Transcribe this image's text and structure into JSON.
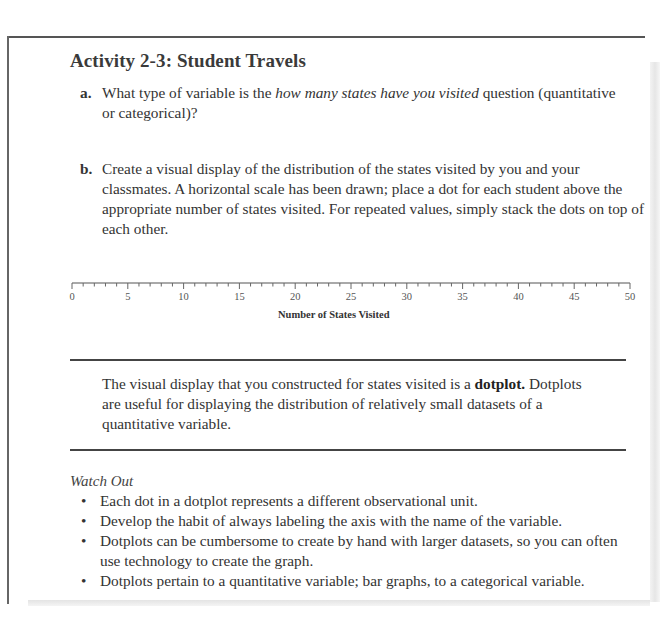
{
  "activity": {
    "title": "Activity 2-3: Student Travels",
    "items": [
      {
        "label": "a.",
        "text_before": "What type of variable is the ",
        "text_italic": "how many states have you visited",
        "text_after": " question (quantitative or categorical)?"
      },
      {
        "label": "b.",
        "text": "Create a visual display of the distribution of the states visited by you and your classmates. A horizontal scale has been drawn; place a dot for each student above the appropriate number of states visited. For repeated values, simply stack the dots on top of each other."
      }
    ]
  },
  "chart_data": {
    "type": "scatter",
    "title": "",
    "xlabel": "Number of States Visited",
    "ylabel": "",
    "xlim": [
      0,
      50
    ],
    "major_tick_step": 5,
    "minor_tick_step": 1,
    "tick_labels": [
      "0",
      "5",
      "10",
      "15",
      "20",
      "25",
      "30",
      "35",
      "40",
      "45",
      "50"
    ],
    "x": [],
    "values": [],
    "grid": false,
    "legend": null
  },
  "callout": {
    "text_before": "The visual display that you constructed for states visited is a ",
    "text_bold": "dotplot.",
    "text_after": " Dotplots are useful for displaying the distribution of relatively small datasets of a quantitative variable."
  },
  "watch_out": {
    "title": "Watch Out",
    "bullet_glyph": "•",
    "items": [
      "Each dot in a dotplot represents a different observational unit.",
      "Develop the habit of always labeling the axis with the name of the variable.",
      "Dotplots can be cumbersome to create by hand with larger datasets, so you can often use technology to create the graph.",
      "Dotplots pertain to a quantitative variable; bar graphs, to a categorical variable."
    ]
  }
}
